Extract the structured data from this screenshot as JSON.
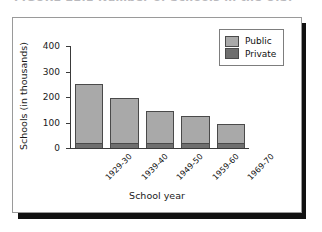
{
  "caption": {
    "text": "FIGURE 22.1   Number of Schools in the U.S."
  },
  "legend": {
    "position": "top-right",
    "items": [
      {
        "label": "Public",
        "color": "#a9a9a9",
        "swatch_icon": "legend-swatch-public"
      },
      {
        "label": "Private",
        "color": "#6f6f6f",
        "swatch_icon": "legend-swatch-private"
      }
    ]
  },
  "chart_data": {
    "type": "bar",
    "stacked": true,
    "title": "",
    "xlabel": "School year",
    "ylabel": "Schools (in thousands)",
    "categories": [
      "1929-30",
      "1939-40",
      "1949-50",
      "1959-60",
      "1969-70"
    ],
    "series": [
      {
        "name": "Private",
        "color": "#6f6f6f",
        "values": [
          20,
          20,
          20,
          20,
          18
        ]
      },
      {
        "name": "Public",
        "color": "#a9a9a9",
        "values": [
          230,
          175,
          125,
          105,
          77
        ]
      }
    ],
    "totals": [
      250,
      195,
      145,
      125,
      95
    ],
    "ylim": [
      0,
      400
    ],
    "yticks": [
      0,
      100,
      200,
      300,
      400
    ],
    "ytick_labels": [
      "0",
      "100",
      "200",
      "300",
      "400"
    ],
    "grid": false,
    "xtick_rotation": -45
  }
}
